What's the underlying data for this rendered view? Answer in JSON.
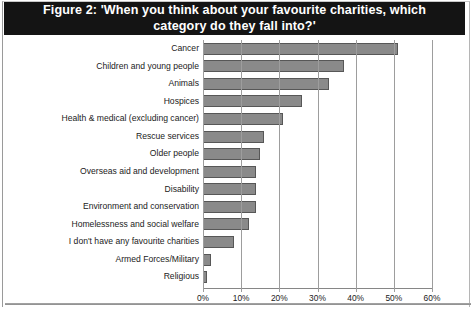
{
  "figure": {
    "title": "Figure 2: 'When you think about your favourite charities, which\ncategory do they fall into?'",
    "title_label": "Figure 2",
    "bar_color": "#8a8a8a",
    "bar_border_color": "#575757",
    "title_bar_color": "#141414",
    "title_text_color": "#ffffff"
  },
  "chart_data": {
    "type": "bar",
    "orientation": "horizontal",
    "title": "Figure 2: 'When you think about your favourite charities, which category do they fall into?'",
    "xlabel": "",
    "ylabel": "",
    "xlim": [
      0,
      60
    ],
    "xticks": [
      0,
      10,
      20,
      30,
      40,
      50,
      60
    ],
    "xtick_labels": [
      "0%",
      "10%",
      "20%",
      "30%",
      "40%",
      "50%",
      "60%"
    ],
    "grid": false,
    "legend": false,
    "value_unit": "%",
    "categories": [
      "Cancer",
      "Children and young people",
      "Animals",
      "Hospices",
      "Health & medical (excluding cancer)",
      "Rescue services",
      "Older people",
      "Overseas aid and development",
      "Disability",
      "Environment and conservation",
      "Homelessness and social welfare",
      "I don't have any favourite charities",
      "Armed Forces/Military",
      "Religious"
    ],
    "values": [
      51,
      37,
      33,
      26,
      21,
      16,
      15,
      14,
      14,
      14,
      12,
      8,
      2,
      1
    ],
    "series": [
      {
        "name": "Share of respondents",
        "values": [
          51,
          37,
          33,
          26,
          21,
          16,
          15,
          14,
          14,
          14,
          12,
          8,
          2,
          1
        ]
      }
    ]
  }
}
